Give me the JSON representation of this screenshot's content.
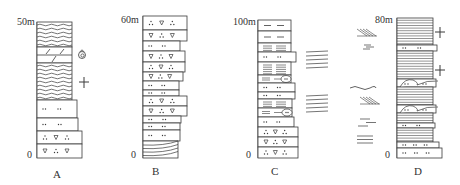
{
  "figure": {
    "stroke_color": "#3a3a3a",
    "background": "#ffffff"
  },
  "columns": [
    {
      "id": "A",
      "label": "A",
      "top_label": "50m",
      "base_label": "0",
      "label_pos": [
        53,
        169
      ],
      "top_label_pos": [
        17,
        17
      ],
      "base_label_pos": [
        27,
        150
      ],
      "x": 37,
      "top": 22,
      "base": 158,
      "beds": [
        {
          "y0": 22,
          "y1": 47,
          "w": 35,
          "lith": "wavy-shale"
        },
        {
          "y0": 47,
          "y1": 63,
          "w": 35,
          "lith": "dolomite"
        },
        {
          "y0": 63,
          "y1": 100,
          "w": 35,
          "lith": "wavy-shale"
        },
        {
          "y0": 100,
          "y1": 118,
          "w": 40,
          "lith": "sandstone"
        },
        {
          "y0": 118,
          "y1": 131,
          "w": 41,
          "lith": "sandstone"
        },
        {
          "y0": 131,
          "y1": 144,
          "w": 45,
          "lith": "pebbly-sandstone"
        },
        {
          "y0": 144,
          "y1": 158,
          "w": 45,
          "lith": "pebbly-sandstone"
        }
      ],
      "side_symbols": [
        {
          "type": "ammonite",
          "x": 82,
          "y": 55
        },
        {
          "type": "plant-cross",
          "x": 84,
          "y": 82
        }
      ]
    },
    {
      "id": "B",
      "label": "B",
      "top_label": "60m",
      "base_label": "0",
      "label_pos": [
        152,
        166
      ],
      "top_label_pos": [
        121,
        15
      ],
      "base_label_pos": [
        131,
        150
      ],
      "x": 143,
      "top": 16,
      "base": 158,
      "beds": [
        {
          "y0": 16,
          "y1": 30,
          "w": 44,
          "lith": "pebbly-sandstone"
        },
        {
          "y0": 30,
          "y1": 41,
          "w": 44,
          "lith": "pebbly-sandstone"
        },
        {
          "y0": 41,
          "y1": 51,
          "w": 37,
          "lith": "sandstone"
        },
        {
          "y0": 51,
          "y1": 62,
          "w": 42,
          "lith": "pebbly-sandstone"
        },
        {
          "y0": 62,
          "y1": 72,
          "w": 42,
          "lith": "pebbly-sandstone"
        },
        {
          "y0": 72,
          "y1": 81,
          "w": 40,
          "lith": "pebbly-sandstone"
        },
        {
          "y0": 81,
          "y1": 90,
          "w": 36,
          "lith": "sandstone"
        },
        {
          "y0": 90,
          "y1": 96,
          "w": 36,
          "lith": "sandstone"
        },
        {
          "y0": 96,
          "y1": 106,
          "w": 44,
          "lith": "pebbly-sandstone"
        },
        {
          "y0": 106,
          "y1": 116,
          "w": 44,
          "lith": "pebbly-sandstone"
        },
        {
          "y0": 116,
          "y1": 123,
          "w": 38,
          "lith": "sandstone"
        },
        {
          "y0": 123,
          "y1": 130,
          "w": 37,
          "lith": "sandstone"
        },
        {
          "y0": 130,
          "y1": 141,
          "w": 37,
          "lith": "sandstone"
        },
        {
          "y0": 141,
          "y1": 158,
          "w": 35,
          "lith": "cross-bedded"
        }
      ],
      "side_symbols": []
    },
    {
      "id": "C",
      "label": "C",
      "top_label": "100m",
      "base_label": "0",
      "label_pos": [
        271,
        166
      ],
      "top_label_pos": [
        233,
        17
      ],
      "base_label_pos": [
        246,
        150
      ],
      "x": 258,
      "top": 20,
      "base": 158,
      "beds": [
        {
          "y0": 20,
          "y1": 31,
          "w": 33,
          "lith": "mudstone"
        },
        {
          "y0": 31,
          "y1": 43,
          "w": 33,
          "lith": "mudstone"
        },
        {
          "y0": 43,
          "y1": 52,
          "w": 33,
          "lith": "laminated"
        },
        {
          "y0": 52,
          "y1": 62,
          "w": 38,
          "lith": "sandstone"
        },
        {
          "y0": 62,
          "y1": 75,
          "w": 33,
          "lith": "laminated"
        },
        {
          "y0": 75,
          "y1": 83,
          "w": 33,
          "lith": "laminated-lens"
        },
        {
          "y0": 83,
          "y1": 92,
          "w": 37,
          "lith": "sandstone"
        },
        {
          "y0": 92,
          "y1": 99,
          "w": 37,
          "lith": "sandstone"
        },
        {
          "y0": 99,
          "y1": 108,
          "w": 34,
          "lith": "laminated"
        },
        {
          "y0": 108,
          "y1": 117,
          "w": 34,
          "lith": "laminated-lens"
        },
        {
          "y0": 117,
          "y1": 127,
          "w": 36,
          "lith": "sandstone"
        },
        {
          "y0": 127,
          "y1": 137,
          "w": 40,
          "lith": "pebbly-sandstone"
        },
        {
          "y0": 137,
          "y1": 147,
          "w": 40,
          "lith": "pebbly-sandstone"
        },
        {
          "y0": 147,
          "y1": 158,
          "w": 40,
          "lith": "pebbly-sandstone"
        }
      ],
      "side_symbols": [
        {
          "type": "horizontal-bedding",
          "x": 306,
          "y": 60
        },
        {
          "type": "horizontal-bedding",
          "x": 306,
          "y": 104
        }
      ]
    },
    {
      "id": "D",
      "label": "D",
      "top_label": "80m",
      "base_label": "0",
      "label_pos": [
        414,
        166
      ],
      "top_label_pos": [
        375,
        15
      ],
      "base_label_pos": [
        385,
        150
      ],
      "x": 397,
      "top": 18,
      "base": 158,
      "beds": [
        {
          "y0": 18,
          "y1": 45,
          "w": 36,
          "lith": "laminated-fine"
        },
        {
          "y0": 45,
          "y1": 51,
          "w": 40,
          "lith": "sandstone"
        },
        {
          "y0": 51,
          "y1": 79,
          "w": 36,
          "lith": "laminated-fine"
        },
        {
          "y0": 79,
          "y1": 87,
          "w": 39,
          "lith": "sandstone-lens"
        },
        {
          "y0": 87,
          "y1": 105,
          "w": 36,
          "lith": "laminated-fine"
        },
        {
          "y0": 105,
          "y1": 113,
          "w": 39,
          "lith": "sandstone-lens"
        },
        {
          "y0": 113,
          "y1": 123,
          "w": 36,
          "lith": "laminated-fine"
        },
        {
          "y0": 123,
          "y1": 128,
          "w": 38,
          "lith": "sandstone"
        },
        {
          "y0": 128,
          "y1": 142,
          "w": 36,
          "lith": "laminated-fine"
        },
        {
          "y0": 142,
          "y1": 148,
          "w": 42,
          "lith": "sandstone"
        },
        {
          "y0": 148,
          "y1": 158,
          "w": 45,
          "lith": "sandstone"
        }
      ],
      "side_symbols": [
        {
          "type": "plant-cross",
          "x": 440,
          "y": 32
        },
        {
          "type": "plant-cross",
          "x": 440,
          "y": 70
        },
        {
          "type": "cross-bedding-left",
          "x": 363,
          "y": 33
        },
        {
          "type": "horizontal-short",
          "x": 368,
          "y": 47
        },
        {
          "type": "wavy",
          "x": 360,
          "y": 88
        },
        {
          "type": "cross-bedding-left",
          "x": 366,
          "y": 101
        },
        {
          "type": "horizontal-offset",
          "x": 366,
          "y": 122
        },
        {
          "type": "horizontal-bedding-small",
          "x": 365,
          "y": 140
        }
      ]
    }
  ]
}
